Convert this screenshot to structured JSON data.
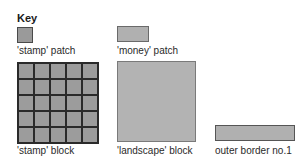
{
  "key": {
    "title": "Key"
  },
  "items": {
    "stamp_patch": {
      "label": "'stamp' patch",
      "color": "#9a9a9a"
    },
    "money_patch": {
      "label": "'money' patch",
      "color": "#b0b0b0"
    },
    "stamp_block": {
      "label": "'stamp' block",
      "color": "#9c9c9c",
      "grid": {
        "rows": 5,
        "cols": 5
      }
    },
    "landscape_block": {
      "label": "'landscape' block",
      "color": "#b3b3b3"
    },
    "outer_border": {
      "label": "outer border no.1",
      "color": "#b0b0b0"
    }
  }
}
